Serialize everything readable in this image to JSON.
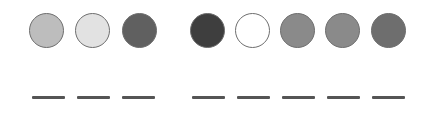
{
  "circles": [
    {
      "x": 29,
      "fill": "#bdbdbd"
    },
    {
      "x": 75,
      "fill": "#e2e2e2"
    },
    {
      "x": 122,
      "fill": "#606060"
    },
    {
      "x": 190,
      "fill": "#3e3e3e"
    },
    {
      "x": 235,
      "fill": "#ffffff"
    },
    {
      "x": 280,
      "fill": "#8a8a8a"
    },
    {
      "x": 325,
      "fill": "#8a8a8a"
    },
    {
      "x": 371,
      "fill": "#6e6e6e"
    }
  ],
  "lines": [
    {
      "x": 32
    },
    {
      "x": 77
    },
    {
      "x": 122
    },
    {
      "x": 192
    },
    {
      "x": 237
    },
    {
      "x": 282
    },
    {
      "x": 327
    },
    {
      "x": 372
    }
  ]
}
